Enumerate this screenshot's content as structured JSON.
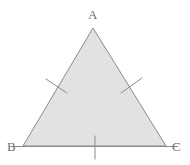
{
  "figure": {
    "type": "geometry-diagram",
    "canvas": {
      "width": 190,
      "height": 165,
      "background": "#ffffff"
    },
    "style": {
      "fill_color": "#e2e2e2",
      "stroke_color": "#8a8a8a",
      "stroke_width": 1,
      "tick_color": "#8a8a8a",
      "tick_width": 1,
      "label_color": "#6f6f6f",
      "label_font_size": 13
    },
    "vertices": [
      {
        "id": "A",
        "label": "A",
        "x": 93,
        "y": 28,
        "label_x": 88,
        "label_y": 8,
        "position": "apex"
      },
      {
        "id": "B",
        "label": "B",
        "x": 23,
        "y": 146,
        "label_x": 7,
        "label_y": 140,
        "position": "bottom-left"
      },
      {
        "id": "C",
        "label": "C",
        "x": 166,
        "y": 146,
        "label_x": 172,
        "label_y": 140,
        "position": "bottom-right"
      }
    ],
    "sides": [
      {
        "id": "AB",
        "from": "A",
        "to": "B",
        "ticks": 1
      },
      {
        "id": "AC",
        "from": "A",
        "to": "C",
        "ticks": 1
      },
      {
        "id": "BC",
        "from": "B",
        "to": "C",
        "ticks": 1
      }
    ],
    "tick_marks": [
      {
        "id": "tick-side-ab",
        "side": "AB",
        "x1": 46,
        "y1": 79,
        "x2": 67,
        "y2": 93
      },
      {
        "id": "tick-side-ac",
        "side": "AC",
        "x1": 121,
        "y1": 93,
        "x2": 142,
        "y2": 78
      },
      {
        "id": "tick-side-bc",
        "side": "BC",
        "x1": 95,
        "y1": 136,
        "x2": 95,
        "y2": 159
      }
    ],
    "base_extension": {
      "id": "base-line",
      "x1": 12,
      "y1": 146,
      "x2": 178,
      "y2": 146
    }
  },
  "chart_data": {
    "type": "diagram",
    "shape": "triangle",
    "points": {
      "A": [
        93,
        28
      ],
      "B": [
        23,
        146
      ],
      "C": [
        166,
        146
      ]
    },
    "labels": [
      "A",
      "B",
      "C"
    ],
    "annotations": [
      "single tick on side AB",
      "single tick on side AC",
      "single tick on side BC"
    ],
    "fill": "#e2e2e2",
    "stroke": "#8a8a8a"
  }
}
